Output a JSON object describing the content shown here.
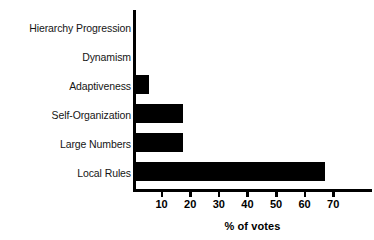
{
  "chart_data": {
    "type": "bar",
    "orientation": "horizontal",
    "title": "",
    "subtitle": "",
    "xlabel": "% of votes",
    "ylabel": "",
    "categories": [
      "Hierarchy Progression",
      "Dynamism",
      "Adaptiveness",
      "Self-Organization",
      "Large Numbers",
      "Local Rules"
    ],
    "values": [
      0,
      0,
      5.5,
      17.5,
      17.5,
      67
    ],
    "xlim": [
      0,
      78
    ],
    "ylim": [
      0,
      6
    ],
    "xticks": [
      10,
      20,
      30,
      40,
      50,
      60,
      70
    ],
    "xtick_labels": [
      "10",
      "20",
      "30",
      "40",
      "50",
      "60",
      "70"
    ],
    "grid": false,
    "legend": false,
    "bar_color": "#000000",
    "axis_color": "#000000",
    "background_color": "#ffffff"
  }
}
